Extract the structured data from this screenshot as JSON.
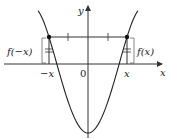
{
  "diagram": {
    "labels": {
      "y_axis": "y",
      "x_axis": "x",
      "origin": "0",
      "neg_x": "−x",
      "pos_x": "x",
      "f_neg_x": "f(−x)",
      "f_x": "f(x)"
    },
    "colors": {
      "curve": "#222222",
      "axes": "#333333",
      "helper": "#444444"
    }
  }
}
